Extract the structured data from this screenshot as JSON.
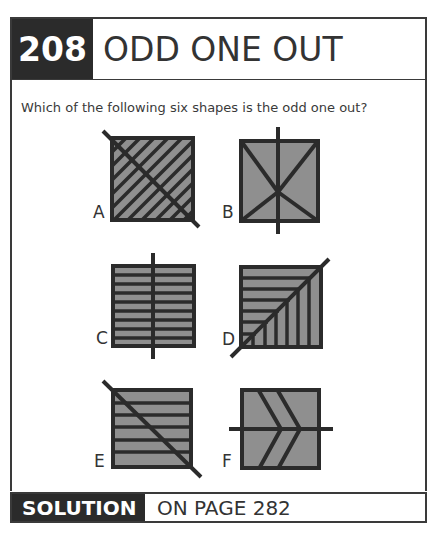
{
  "header": {
    "puzzle_number": "208",
    "title": "ODD ONE OUT"
  },
  "question": "Which of the following six shapes is the odd one out?",
  "shapes": [
    {
      "label": "A",
      "description": "square with diagonal stripes and a crossing diagonal line"
    },
    {
      "label": "B",
      "description": "square with vertical line and four lines meeting below center"
    },
    {
      "label": "C",
      "description": "square with horizontal stripes and a vertical line"
    },
    {
      "label": "D",
      "description": "square with diagonal line, horizontal lines above and vertical lines below"
    },
    {
      "label": "E",
      "description": "square with horizontal stripes and a crossing diagonal line"
    },
    {
      "label": "F",
      "description": "square with horizontal line and two chevrons"
    }
  ],
  "colors": {
    "fill": "#8f8f8f",
    "stroke": "#2b2b2b",
    "dark_block": "#2b2b2b"
  },
  "footer": {
    "solution_label": "SOLUTION",
    "page_reference": "ON PAGE 282"
  }
}
